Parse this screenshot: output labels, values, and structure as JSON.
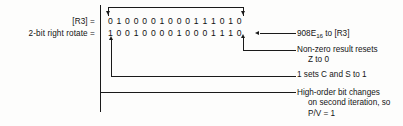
{
  "figure": {
    "ink_color": "#1a1a1a",
    "background": "#fdfdfc"
  },
  "labels": {
    "register": "[R3] =",
    "operation": "2-bit right rotate ="
  },
  "bits": {
    "before_label": "[R3] =",
    "before": [
      "0",
      "1",
      "0",
      "0",
      "0",
      "0",
      "1",
      "0",
      "0",
      "0",
      "1",
      "1",
      "1",
      "0",
      "1",
      "0"
    ],
    "after_label": "2-bit right rotate =",
    "after": [
      "1",
      "0",
      "0",
      "1",
      "0",
      "0",
      "0",
      "0",
      "1",
      "0",
      "0",
      "0",
      "1",
      "1",
      "1",
      "0"
    ],
    "bit_count": 16
  },
  "annotations": {
    "hex_result": {
      "text_before": "908E",
      "subscript": "16",
      "text_after": " to [R3]"
    },
    "zero_flag": {
      "line1": "Non-zero result resets",
      "line2": "Z to 0"
    },
    "carry_sign": {
      "line1": "1 sets C and S to 1"
    },
    "overflow": {
      "line1": "High-order bit changes",
      "line2": "on second iteration, so",
      "line3": "P/V = 1"
    }
  }
}
